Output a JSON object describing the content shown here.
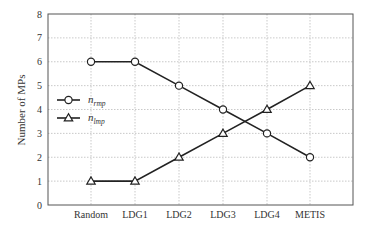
{
  "chart_data": {
    "type": "line",
    "title": "",
    "xlabel": "",
    "ylabel": "Number of MPs",
    "categories": [
      "Random",
      "LDG1",
      "LDG2",
      "LDG3",
      "LDG4",
      "METIS"
    ],
    "series": [
      {
        "name": "n_rmp",
        "label_main": "n",
        "label_sub": "rmp",
        "marker": "circle",
        "values": [
          6,
          6,
          5,
          4,
          3,
          2
        ]
      },
      {
        "name": "n_lmp",
        "label_main": "n",
        "label_sub": "lmp",
        "marker": "triangle",
        "values": [
          1,
          1,
          2,
          3,
          4,
          5
        ]
      }
    ],
    "ylim": [
      0,
      8
    ],
    "yticks": [
      0,
      1,
      2,
      3,
      4,
      5,
      6,
      7,
      8
    ],
    "grid": true,
    "legend_position": "left-middle",
    "colors": {
      "line": "#222222",
      "grid": "#bbbbbb",
      "axis": "#444444"
    }
  }
}
